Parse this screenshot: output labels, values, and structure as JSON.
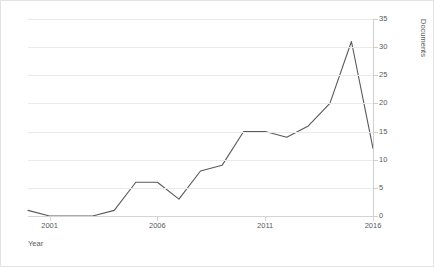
{
  "chart_data": {
    "type": "line",
    "title": "",
    "subtitle": "",
    "xlabel": "Year",
    "ylabel": "Documents",
    "x": [
      2000,
      2001,
      2002,
      2003,
      2004,
      2005,
      2006,
      2007,
      2008,
      2009,
      2010,
      2011,
      2012,
      2013,
      2014,
      2015,
      2016
    ],
    "values": [
      1,
      0,
      0,
      0,
      1,
      6,
      6,
      3,
      8,
      9,
      15,
      15,
      14,
      16,
      20,
      31,
      12
    ],
    "series": [
      {
        "name": "Documents",
        "values": [
          1,
          0,
          0,
          0,
          1,
          6,
          6,
          3,
          8,
          9,
          15,
          15,
          14,
          16,
          20,
          31,
          12
        ]
      }
    ],
    "xlim": [
      2000,
      2016
    ],
    "ylim": [
      0,
      35
    ],
    "y_ticks": [
      0,
      5,
      10,
      15,
      20,
      25,
      30,
      35
    ],
    "x_ticks": [
      2001,
      2006,
      2011,
      2016
    ],
    "x_tick_labels": [
      "2001",
      "2006",
      "2011",
      "2016"
    ],
    "y_tick_labels": [
      "0",
      "5",
      "10",
      "15",
      "20",
      "25",
      "30",
      "35"
    ],
    "grid": "horizontal",
    "legend": "none",
    "y_axis_position": "right",
    "line_color": "#595959",
    "grid_color": "#e9e9e9",
    "background_color": "#ffffff",
    "annotations": []
  }
}
